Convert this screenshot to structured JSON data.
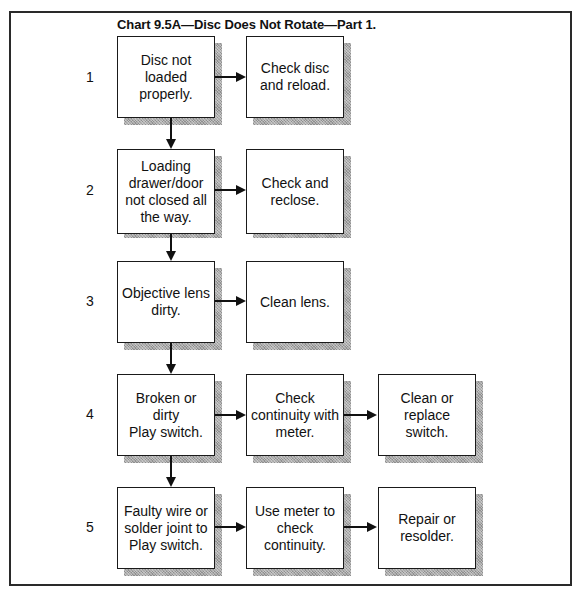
{
  "title": "Chart 9.5A—Disc Does Not Rotate—Part 1.",
  "rows": [
    {
      "step": "1",
      "cells": [
        "Disc not\nloaded\nproperly.",
        "Check disc\nand reload."
      ]
    },
    {
      "step": "2",
      "cells": [
        "Loading\ndrawer/door\nnot closed all\nthe way.",
        "Check and\nreclose."
      ]
    },
    {
      "step": "3",
      "cells": [
        "Objective lens\ndirty.",
        "Clean lens."
      ]
    },
    {
      "step": "4",
      "cells": [
        "Broken or dirty\nPlay switch.",
        "Check\ncontinuity with\nmeter.",
        "Clean or\nreplace\nswitch."
      ]
    },
    {
      "step": "5",
      "cells": [
        "Faulty wire or\nsolder joint to\nPlay switch.",
        "Use meter to\ncheck\ncontinuity.",
        "Repair or\nresolder."
      ]
    }
  ],
  "colors": {
    "line": "#111111",
    "shadow": "#a8a8a8",
    "box_fill": "#ffffff"
  }
}
